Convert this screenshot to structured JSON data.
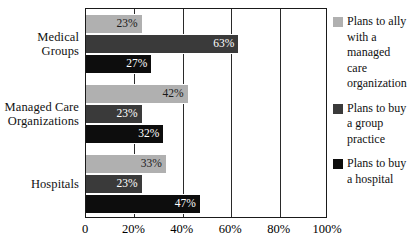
{
  "chart_data": {
    "type": "bar",
    "orientation": "horizontal",
    "title": "",
    "xlabel": "",
    "ylabel": "",
    "xlim": [
      0,
      100
    ],
    "grid": true,
    "legend_position": "right",
    "categories": [
      "Medical\nGroups",
      "Managed Care\nOrganizations",
      "Hospitals"
    ],
    "xticks": [
      "0",
      "20%",
      "40%",
      "60%",
      "80%",
      "100%"
    ],
    "xtick_values": [
      0,
      20,
      40,
      60,
      80,
      100
    ],
    "series": [
      {
        "name": "Plans to ally with a managed care organization",
        "color": "#b0b0b0",
        "values": [
          23,
          42,
          33
        ],
        "labels": [
          "23%",
          "42%",
          "33%"
        ]
      },
      {
        "name": "Plans to buy a group practice",
        "color": "#3a3a3a",
        "values": [
          63,
          23,
          23
        ],
        "labels": [
          "63%",
          "23%",
          "23%"
        ]
      },
      {
        "name": "Plans to buy a hospital",
        "color": "#0d0d0d",
        "values": [
          27,
          32,
          47
        ],
        "labels": [
          "27%",
          "32%",
          "47%"
        ]
      }
    ]
  },
  "legend": {
    "items": [
      {
        "label": "Plans to ally with a managed care organization",
        "color": "#b0b0b0"
      },
      {
        "label": "Plans to buy a group practice",
        "color": "#3a3a3a"
      },
      {
        "label": "Plans to buy a hospital",
        "color": "#0d0d0d"
      }
    ]
  }
}
